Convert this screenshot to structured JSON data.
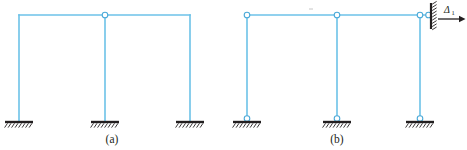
{
  "figure": {
    "background_color": "#ffffff",
    "member_color": "#6cc2e8",
    "member_color_dark": "#4aa9d8",
    "support_color": "#231f20",
    "member_stroke_width": 1.6,
    "hinge_radius": 2.6,
    "panels": [
      {
        "id": "panel-a",
        "caption": "(a)",
        "caption_x": 112,
        "caption_y": 143,
        "beam_y": 15,
        "base_y": 122,
        "columns_x": [
          19,
          105,
          190
        ],
        "beam_x_start": 19,
        "beam_x_end": 190,
        "top_hinges": [
          {
            "x": 105,
            "y": 15,
            "name": "hinge-top-middle"
          }
        ],
        "corner_joints": [],
        "base_hinges": [],
        "supports": [
          {
            "x": 19,
            "y": 122,
            "type": "fixed",
            "name": "fixed-support-left"
          },
          {
            "x": 105,
            "y": 122,
            "type": "fixed",
            "name": "fixed-support-middle"
          },
          {
            "x": 190,
            "y": 122,
            "type": "fixed",
            "name": "fixed-support-right"
          }
        ],
        "wall": null,
        "load": null
      },
      {
        "id": "panel-b",
        "caption": "(b)",
        "caption_x": 337,
        "caption_y": 143,
        "beam_y": 15,
        "base_y": 122,
        "columns_x": [
          247,
          337,
          420
        ],
        "beam_x_start": 247,
        "beam_x_end": 423,
        "top_hinges": [
          {
            "x": 247,
            "y": 15,
            "name": "hinge-top-left"
          },
          {
            "x": 337,
            "y": 15,
            "name": "hinge-top-middle"
          },
          {
            "x": 420,
            "y": 15,
            "name": "hinge-top-right"
          },
          {
            "x": 428,
            "y": 15,
            "name": "hinge-wall-connection"
          }
        ],
        "base_hinges": [
          {
            "x": 247,
            "y": 118,
            "name": "hinge-base-left"
          },
          {
            "x": 337,
            "y": 118,
            "name": "hinge-base-middle"
          },
          {
            "x": 420,
            "y": 118,
            "name": "hinge-base-right"
          }
        ],
        "supports": [
          {
            "x": 247,
            "y": 122,
            "type": "pinned",
            "name": "pinned-support-left"
          },
          {
            "x": 337,
            "y": 122,
            "type": "pinned",
            "name": "pinned-support-middle"
          },
          {
            "x": 420,
            "y": 122,
            "type": "pinned",
            "name": "pinned-support-right"
          }
        ],
        "wall": {
          "x": 430,
          "y_top": 3,
          "y_bottom": 30,
          "name": "support-wall-right",
          "hatch_side": "right"
        },
        "load": {
          "label": "Δ",
          "subscript": "1",
          "arrow_x_start": 437,
          "arrow_x_end": 463,
          "arrow_y": 18,
          "label_x": 444,
          "label_y": 12,
          "name": "displacement-arrow-delta1"
        }
      }
    ]
  }
}
